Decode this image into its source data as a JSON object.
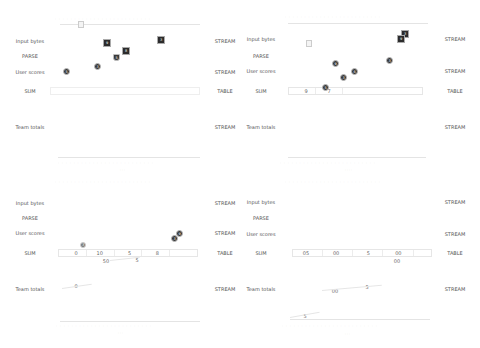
{
  "rows": {
    "input": "Input bytes",
    "parse": "PARSE",
    "scores": "User scores",
    "sum": "SUM",
    "totals": "Team totals"
  },
  "types": {
    "stream": "STREAM",
    "table": "TABLE"
  },
  "panels": [
    {
      "id": "top-left",
      "ruler_label": "",
      "markers": [
        {
          "shape": "ghost-box",
          "x": 78,
          "y": 21,
          "label": ""
        },
        {
          "shape": "square",
          "x": 103,
          "y": 39,
          "label": "9"
        },
        {
          "shape": "square",
          "x": 122,
          "y": 47,
          "label": "8"
        },
        {
          "shape": "square",
          "x": 157,
          "y": 36,
          "label": "3"
        },
        {
          "shape": "shield",
          "x": 113,
          "y": 54,
          "label": "5"
        },
        {
          "shape": "circle",
          "x": 94,
          "y": 63,
          "label": "3"
        },
        {
          "shape": "circle",
          "x": 63,
          "y": 68,
          "label": "5"
        }
      ]
    },
    {
      "id": "top-right",
      "markers": [
        {
          "shape": "ghost-box",
          "x": 306,
          "y": 40,
          "label": ""
        },
        {
          "shape": "square",
          "x": 401,
          "y": 30,
          "label": "3"
        },
        {
          "shape": "square",
          "x": 397,
          "y": 35,
          "label": "9"
        },
        {
          "shape": "circle",
          "x": 332,
          "y": 60,
          "label": "9"
        },
        {
          "shape": "circle",
          "x": 351,
          "y": 68,
          "label": "6"
        },
        {
          "shape": "circle",
          "x": 386,
          "y": 57,
          "label": "3"
        },
        {
          "shape": "circle",
          "x": 340,
          "y": 74,
          "label": "3"
        },
        {
          "shape": "circle",
          "x": 322,
          "y": 84,
          "label": "5"
        }
      ],
      "table_values": [
        "9",
        "7",
        "",
        ""
      ]
    },
    {
      "id": "bottom-left",
      "markers": [
        {
          "shape": "light-circle",
          "x": 80,
          "y": 242,
          "label": "3"
        },
        {
          "shape": "circle",
          "x": 173,
          "y": 234,
          "label": "9"
        },
        {
          "shape": "circle",
          "x": 169,
          "y": 239,
          "label": "3"
        }
      ],
      "table_values": [
        "0",
        "10",
        "5",
        "8"
      ],
      "below_values": [
        "50",
        "5"
      ],
      "totals_values": [
        "0"
      ]
    },
    {
      "id": "bottom-right",
      "table_values": [
        "05",
        "00",
        "5",
        "00"
      ],
      "below_values": [
        "00"
      ],
      "totals_values": [
        "00",
        "5",
        "5"
      ]
    }
  ]
}
